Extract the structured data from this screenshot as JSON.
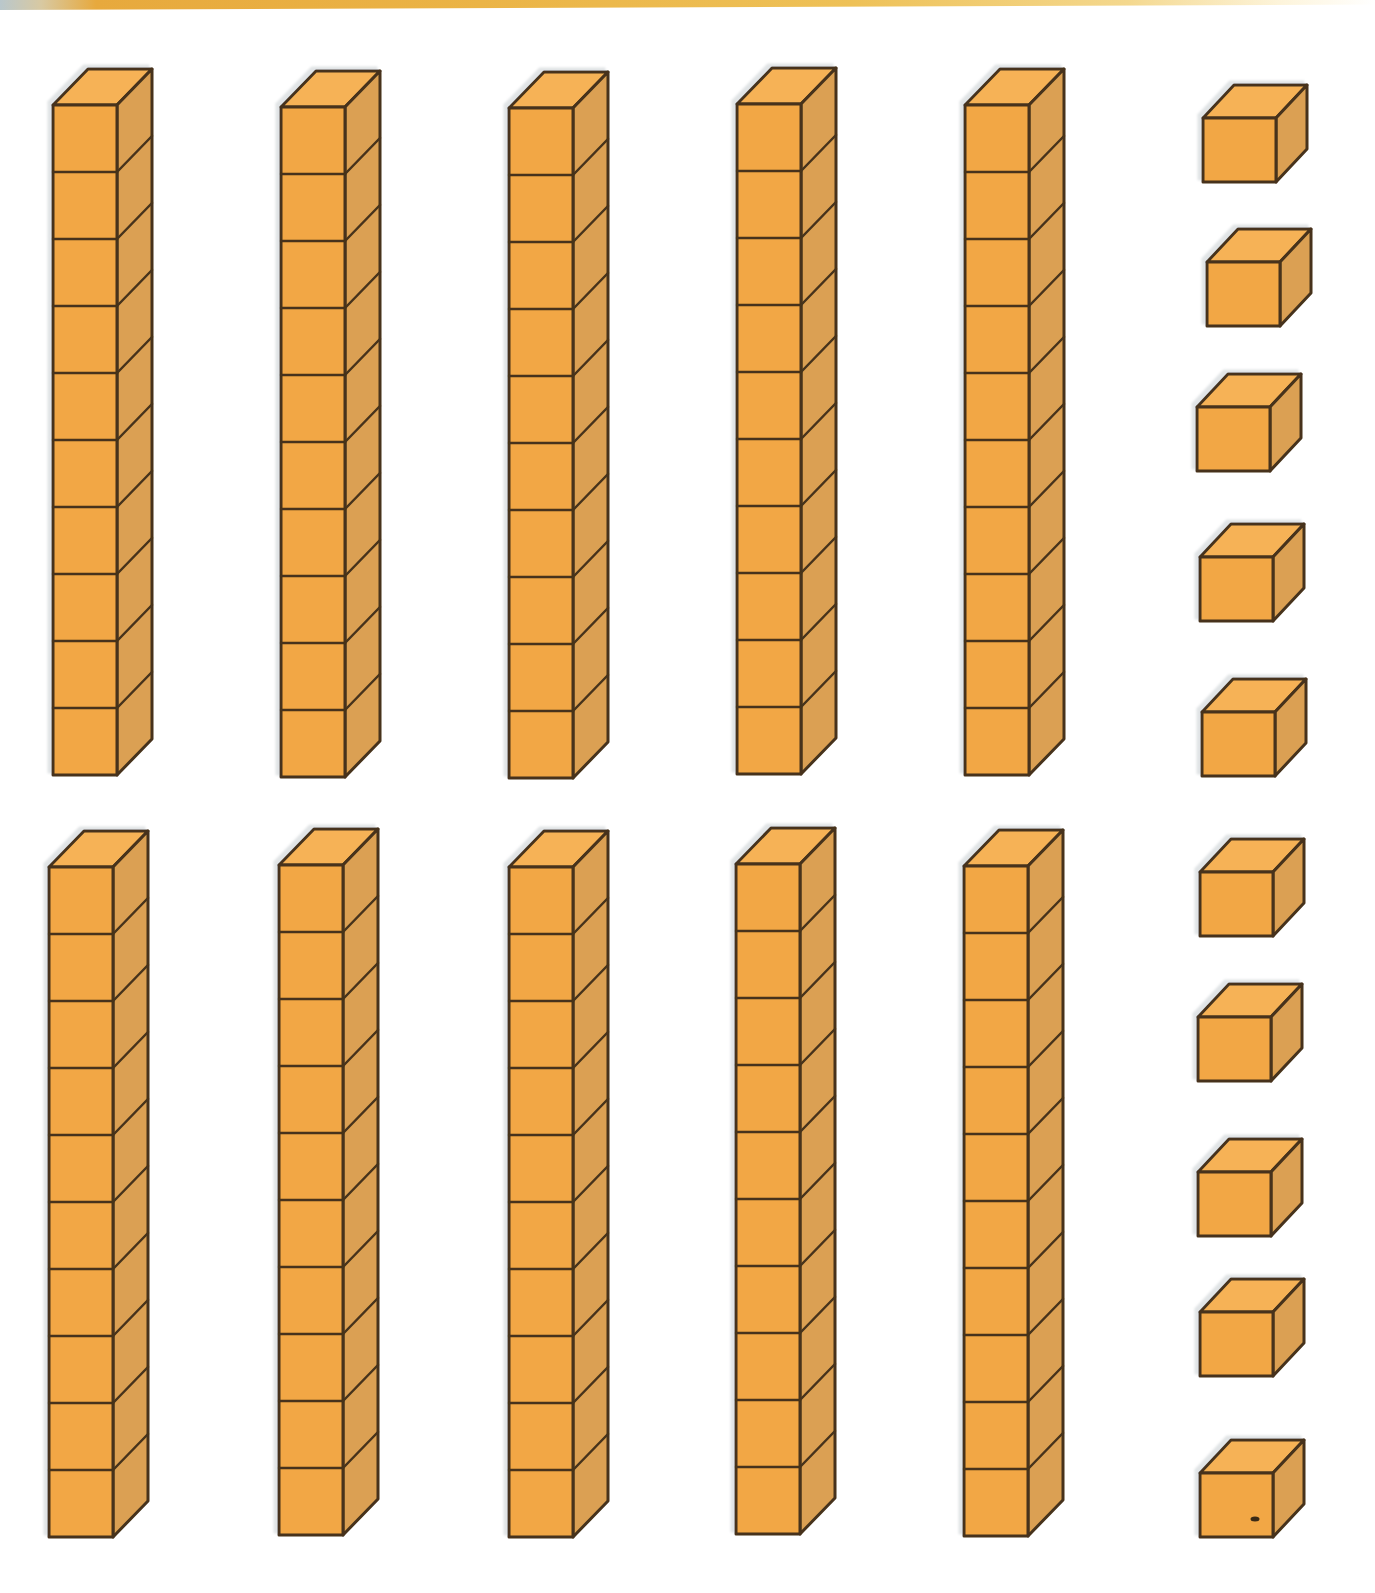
{
  "page": {
    "width": 1375,
    "height": 1593,
    "background": "#ffffff"
  },
  "top_edge": {
    "height": 10,
    "stops": [
      [
        "0%",
        "#b9c7cc"
      ],
      [
        "3%",
        "#d8c9a2"
      ],
      [
        "7%",
        "#e7a93d"
      ],
      [
        "35%",
        "#ebb446"
      ],
      [
        "62%",
        "#eec157"
      ],
      [
        "82%",
        "#f4d88e"
      ],
      [
        "93%",
        "#fdf4da"
      ],
      [
        "100%",
        "#ffffff"
      ]
    ]
  },
  "palette": {
    "front": "#F2A745",
    "side": "#DBA052",
    "top": "#F6B257",
    "outline": "#46331A",
    "halo": "#bcc3c7",
    "speck": "#3a2c18"
  },
  "block_geometry": {
    "rod": {
      "front_width": 64,
      "segment_height": 67,
      "segments": 10,
      "depth_x": 35,
      "depth_y": 36,
      "outline_width": 3,
      "divider_width": 2.5
    },
    "cube": {
      "front_width": 73,
      "front_height": 64,
      "depth_x": 31,
      "depth_y": 33,
      "outline_width": 3
    }
  },
  "tens_rods": [
    {
      "id": "rod-1",
      "row": 1,
      "x": 53,
      "y": 105
    },
    {
      "id": "rod-2",
      "row": 1,
      "x": 281,
      "y": 107
    },
    {
      "id": "rod-3",
      "row": 1,
      "x": 509,
      "y": 108
    },
    {
      "id": "rod-4",
      "row": 1,
      "x": 737,
      "y": 104
    },
    {
      "id": "rod-5",
      "row": 1,
      "x": 965,
      "y": 105
    },
    {
      "id": "rod-6",
      "row": 2,
      "x": 49,
      "y": 867
    },
    {
      "id": "rod-7",
      "row": 2,
      "x": 279,
      "y": 865
    },
    {
      "id": "rod-8",
      "row": 2,
      "x": 509,
      "y": 867
    },
    {
      "id": "rod-9",
      "row": 2,
      "x": 736,
      "y": 864
    },
    {
      "id": "rod-10",
      "row": 2,
      "x": 964,
      "y": 866
    }
  ],
  "ones_cubes": [
    {
      "id": "cube-1",
      "x": 1203,
      "y": 118
    },
    {
      "id": "cube-2",
      "x": 1207,
      "y": 262
    },
    {
      "id": "cube-3",
      "x": 1197,
      "y": 407
    },
    {
      "id": "cube-4",
      "x": 1200,
      "y": 557
    },
    {
      "id": "cube-5",
      "x": 1202,
      "y": 712
    },
    {
      "id": "cube-6",
      "x": 1200,
      "y": 872
    },
    {
      "id": "cube-7",
      "x": 1198,
      "y": 1017
    },
    {
      "id": "cube-8",
      "x": 1198,
      "y": 1172
    },
    {
      "id": "cube-9",
      "x": 1200,
      "y": 1312
    },
    {
      "id": "cube-10",
      "x": 1200,
      "y": 1473,
      "speck": {
        "dx": 55,
        "dy": 46
      }
    }
  ],
  "summary": {
    "tens_count": 10,
    "ones_count": 10
  }
}
